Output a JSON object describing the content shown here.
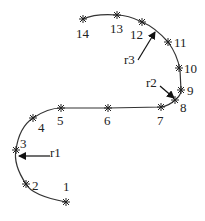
{
  "diagram": {
    "points": [
      {
        "label": "1",
        "x": 66,
        "y": 202,
        "lx": 63,
        "ly": 191
      },
      {
        "label": "2",
        "x": 26,
        "y": 184,
        "lx": 32,
        "ly": 190
      },
      {
        "label": "3",
        "x": 16,
        "y": 150,
        "lx": 20,
        "ly": 148
      },
      {
        "label": "4",
        "x": 33,
        "y": 118,
        "lx": 38,
        "ly": 132
      },
      {
        "label": "5",
        "x": 61,
        "y": 108,
        "lx": 57,
        "ly": 125
      },
      {
        "label": "6",
        "x": 108,
        "y": 108,
        "lx": 104,
        "ly": 125
      },
      {
        "label": "7",
        "x": 161,
        "y": 107,
        "lx": 157,
        "ly": 125
      },
      {
        "label": "8",
        "x": 175,
        "y": 100,
        "lx": 180,
        "ly": 112
      },
      {
        "label": "9",
        "x": 181,
        "y": 90,
        "lx": 187,
        "ly": 95
      },
      {
        "label": "10",
        "x": 179,
        "y": 68,
        "lx": 184,
        "ly": 73
      },
      {
        "label": "11",
        "x": 168,
        "y": 42,
        "lx": 174,
        "ly": 47
      },
      {
        "label": "12",
        "x": 142,
        "y": 22,
        "lx": 130,
        "ly": 39
      },
      {
        "label": "13",
        "x": 117,
        "y": 15,
        "lx": 110,
        "ly": 33
      },
      {
        "label": "14",
        "x": 83,
        "y": 19,
        "lx": 76,
        "ly": 38
      }
    ],
    "arrows": [
      {
        "label": "r1",
        "lx": 50,
        "ly": 157,
        "x1": 50,
        "y1": 156,
        "x2": 19,
        "y2": 156
      },
      {
        "label": "r2",
        "lx": 146,
        "ly": 87,
        "x1": 160,
        "y1": 86,
        "x2": 174,
        "y2": 98
      },
      {
        "label": "r3",
        "lx": 124,
        "ly": 64,
        "x1": 138,
        "y1": 60,
        "x2": 155,
        "y2": 32
      }
    ]
  }
}
